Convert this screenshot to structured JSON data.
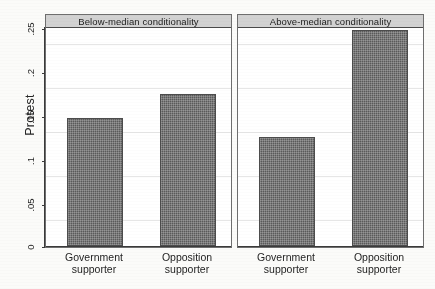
{
  "chart_data": {
    "type": "bar",
    "title": "",
    "xlabel": "",
    "ylabel": "Protest",
    "ylim": [
      0,
      0.25
    ],
    "grid": true,
    "legend": "none",
    "yticks": [
      {
        "value": 0,
        "label": "0"
      },
      {
        "value": 0.05,
        "label": ".05"
      },
      {
        "value": 0.1,
        "label": ".1"
      },
      {
        "value": 0.15,
        "label": ".15"
      },
      {
        "value": 0.2,
        "label": ".2"
      },
      {
        "value": 0.25,
        "label": ".25"
      }
    ],
    "categories": [
      "Government supporter",
      "Opposition supporter"
    ],
    "panels": [
      {
        "title": "Below-median conditionality",
        "bars": [
          {
            "category_line1": "Government",
            "category_line2": "supporter",
            "value": 0.145
          },
          {
            "category_line1": "Opposition",
            "category_line2": "supporter",
            "value": 0.173
          }
        ]
      },
      {
        "title": "Above-median conditionality",
        "bars": [
          {
            "category_line1": "Government",
            "category_line2": "supporter",
            "value": 0.124
          },
          {
            "category_line1": "Opposition",
            "category_line2": "supporter",
            "value": 0.246
          }
        ]
      }
    ],
    "colors": {
      "bar_fill": "#5a5a5a",
      "bar_border": "#4c4c4c",
      "panel_title_bg": "#d2d2d2",
      "axis": "#3a3a3a",
      "gridline": "#e6e6e6",
      "background": "#fbfbf9"
    }
  }
}
